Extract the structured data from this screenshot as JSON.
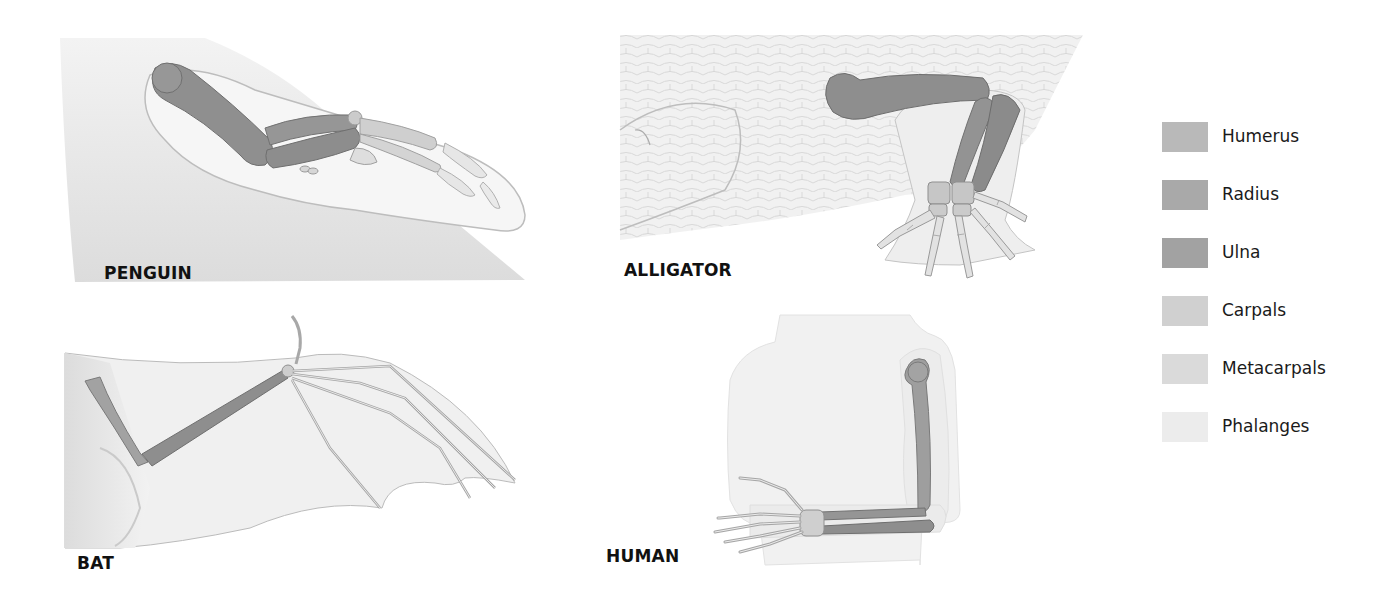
{
  "panels": [
    {
      "id": "penguin",
      "label": "PENGUIN"
    },
    {
      "id": "alligator",
      "label": "ALLIGATOR"
    },
    {
      "id": "bat",
      "label": "BAT"
    },
    {
      "id": "human",
      "label": "HUMAN"
    }
  ],
  "legend": {
    "items": [
      {
        "label": "Humerus",
        "color": "#b9b9b9"
      },
      {
        "label": "Radius",
        "color": "#a9a9a9"
      },
      {
        "label": "Ulna",
        "color": "#a2a2a2"
      },
      {
        "label": "Carpals",
        "color": "#d0d0d0"
      },
      {
        "label": "Metacarpals",
        "color": "#dadada"
      },
      {
        "label": "Phalanges",
        "color": "#ececec"
      }
    ]
  },
  "colors": {
    "skin": "#eeeeee",
    "skin_shadow": "#d6d6d6",
    "outline": "#9a9a9a",
    "bone_dark": "#8f8f8f",
    "bone_mid": "#9c9c9c",
    "bone_light": "#cfcfcf",
    "bone_pale": "#e4e4e4",
    "label_text": "#111111"
  }
}
